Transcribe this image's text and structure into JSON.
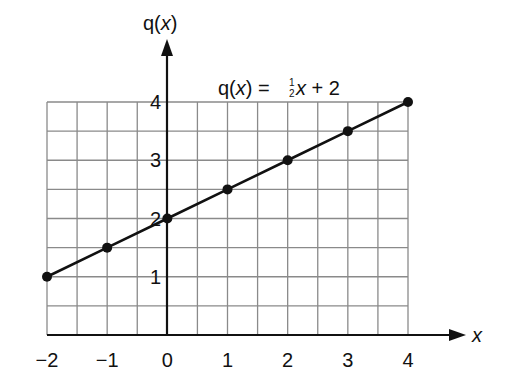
{
  "chart_data": {
    "type": "line",
    "xlabel": "x",
    "ylabel": "q(x)",
    "xlim": [
      -2,
      4
    ],
    "ylim": [
      0,
      4
    ],
    "grid": true,
    "grid_step": 0.5,
    "x_ticks": [
      "-2",
      "-1",
      "0",
      "1",
      "2",
      "3",
      "4"
    ],
    "y_ticks": [
      "1",
      "2",
      "3",
      "4"
    ],
    "series": [
      {
        "name": "q(x) = ½x + 2",
        "x": [
          -2,
          -1,
          0,
          1,
          2,
          3,
          4
        ],
        "y": [
          1,
          1.5,
          2,
          2.5,
          3,
          3.5,
          4
        ]
      }
    ]
  },
  "labels": {
    "y_axis": "q(x)",
    "x_axis": "x",
    "equation_prefix": "q(x) = ",
    "equation_frac_num": "1",
    "equation_frac_den": "2",
    "equation_suffix_var": "x",
    "equation_suffix": " + 2",
    "x_tick_labels": [
      "−2",
      "−1",
      "0",
      "1",
      "2",
      "3",
      "4"
    ],
    "y_tick_labels": [
      "1",
      "2",
      "3",
      "4"
    ]
  },
  "colors": {
    "grid": "#8a8a8a",
    "line": "#111111",
    "axis": "#111111"
  }
}
